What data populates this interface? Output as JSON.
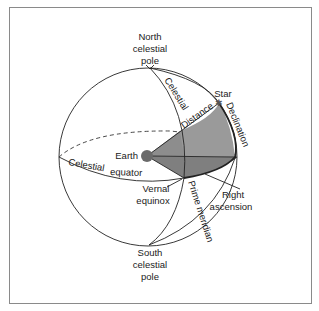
{
  "diagram": {
    "colors": {
      "shade_light": "#9a9a9a",
      "shade_dark": "#7d7d7d",
      "earth": "#6a6a6a",
      "line": "#222222",
      "frame": "#8a8a8a"
    },
    "labels": {
      "north_pole": [
        "North",
        "celestial",
        "pole"
      ],
      "south_pole": [
        "South",
        "celestial",
        "pole"
      ],
      "star": "Star",
      "earth": "Earth",
      "celestial_arc": "Celestial",
      "distance": "Distance",
      "declination": "Declination",
      "celestial_equator_1": "Celestial",
      "celestial_equator_2": "equator",
      "vernal_equinox": [
        "Vernal",
        "equinox"
      ],
      "prime_meridian": "Prime meridian",
      "right_ascension": [
        "Right",
        "ascension"
      ]
    }
  }
}
